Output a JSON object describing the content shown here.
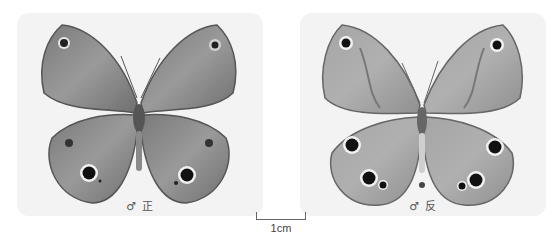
{
  "figure": {
    "panels": [
      {
        "id": "upperside",
        "caption": "♂ 正",
        "view": "dorsal (upperside)"
      },
      {
        "id": "underside",
        "caption": "♂ 反",
        "view": "ventral (underside)"
      }
    ],
    "scale_bar": {
      "label": "1cm"
    },
    "colors": {
      "panel_bg": "#f3f3f3",
      "wing_upper": "#8a8a8a",
      "wing_under": "#9c9c9c",
      "eyespot": "#1a1a1a"
    }
  }
}
